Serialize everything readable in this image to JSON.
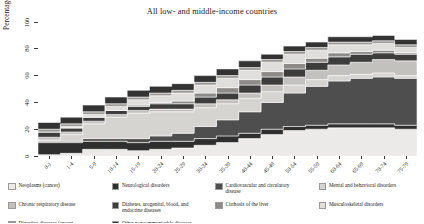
{
  "chart_data": {
    "type": "area",
    "title": "All low- and middle-income countries",
    "xlabel": "",
    "ylabel": "Percentage of total DALYs",
    "ylim": [
      0,
      100
    ],
    "yticks": [
      0,
      20,
      40,
      60,
      80,
      100
    ],
    "grid": false,
    "legend_position": "bottom",
    "stacked": true,
    "step": true,
    "categories": [
      "0-1",
      "1-4",
      "5-9",
      "10-14",
      "15-19",
      "20-24",
      "25-29",
      "30-34",
      "35-39",
      "40-44",
      "45-49",
      "50-54",
      "55-59",
      "60-64",
      "65-69",
      "70-74",
      "75-79"
    ],
    "series": [
      {
        "name": "Neoplasms (cancer)",
        "color": "#ebeae8",
        "values": [
          1,
          2,
          5,
          5,
          4,
          5,
          6,
          8,
          10,
          13,
          16,
          19,
          20,
          21,
          21,
          21,
          20
        ]
      },
      {
        "name": "Neurological disorders",
        "color": "#2f2f2f",
        "values": [
          9,
          8,
          6,
          6,
          6,
          6,
          5,
          5,
          5,
          4,
          4,
          3,
          3,
          3,
          3,
          3,
          3
        ]
      },
      {
        "name": "Cardiovascular and circulatory disease",
        "color": "#4e4e4e",
        "values": [
          1,
          1,
          2,
          2,
          3,
          4,
          6,
          9,
          12,
          16,
          20,
          25,
          29,
          32,
          34,
          35,
          35
        ]
      },
      {
        "name": "Mental and behavioral disorders",
        "color": "#d6d4d0",
        "values": [
          1,
          5,
          11,
          16,
          19,
          18,
          16,
          14,
          12,
          10,
          8,
          6,
          5,
          4,
          3,
          3,
          2
        ]
      },
      {
        "name": "Chronic respiratory disease",
        "color": "#c3c1bd",
        "values": [
          2,
          2,
          2,
          2,
          2,
          2,
          2,
          3,
          3,
          4,
          5,
          6,
          7,
          8,
          9,
          10,
          11
        ]
      },
      {
        "name": "Diabetes, urogenital, blood, and endocrine diseases",
        "color": "#3d3d3d",
        "values": [
          4,
          3,
          3,
          3,
          3,
          4,
          4,
          5,
          5,
          6,
          6,
          6,
          6,
          6,
          6,
          5,
          5
        ]
      },
      {
        "name": "Cirrhosis of the liver",
        "color": "#8d8b88",
        "values": [
          0,
          0,
          0,
          0,
          1,
          1,
          2,
          3,
          4,
          4,
          4,
          4,
          3,
          3,
          2,
          2,
          1
        ]
      },
      {
        "name": "Musculoskeletal disorders",
        "color": "#e0dedb",
        "values": [
          0,
          1,
          2,
          3,
          4,
          5,
          6,
          6,
          7,
          7,
          7,
          7,
          6,
          6,
          5,
          5,
          4
        ]
      },
      {
        "name": "Digestive diseases (except cirrhosis)",
        "color": "#9b9996",
        "values": [
          2,
          2,
          2,
          2,
          2,
          2,
          2,
          2,
          2,
          2,
          2,
          2,
          2,
          2,
          2,
          2,
          2
        ]
      },
      {
        "name": "Other noncommunicable diseases",
        "color": "#333333",
        "values": [
          5,
          5,
          5,
          5,
          5,
          5,
          5,
          5,
          5,
          5,
          4,
          4,
          4,
          4,
          4,
          4,
          4
        ]
      }
    ]
  },
  "legend": {
    "items": [
      {
        "label": "Neoplasms (cancer)",
        "color": "#ebeae8"
      },
      {
        "label": "Cardiovascular and circulatory disease",
        "color": "#4e4e4e"
      },
      {
        "label": "Chronic respiratory disease",
        "color": "#c3c1bd"
      },
      {
        "label": "Cirrhosis of the liver",
        "color": "#8d8b88"
      },
      {
        "label": "Digestive diseases (except cirrhosis)",
        "color": "#9b9996"
      },
      {
        "label": "Neurological disorders",
        "color": "#2f2f2f"
      },
      {
        "label": "Mental and behavioral disorders",
        "color": "#d6d4d0"
      },
      {
        "label": "Diabetes, urogenital, blood, and endocrine diseases",
        "color": "#3d3d3d"
      },
      {
        "label": "Musculoskeletal disorders",
        "color": "#e0dedb"
      },
      {
        "label": "Other noncommunicable diseases",
        "color": "#333333"
      }
    ],
    "order": [
      0,
      5,
      1,
      6,
      2,
      7,
      3,
      8,
      4,
      9
    ]
  }
}
